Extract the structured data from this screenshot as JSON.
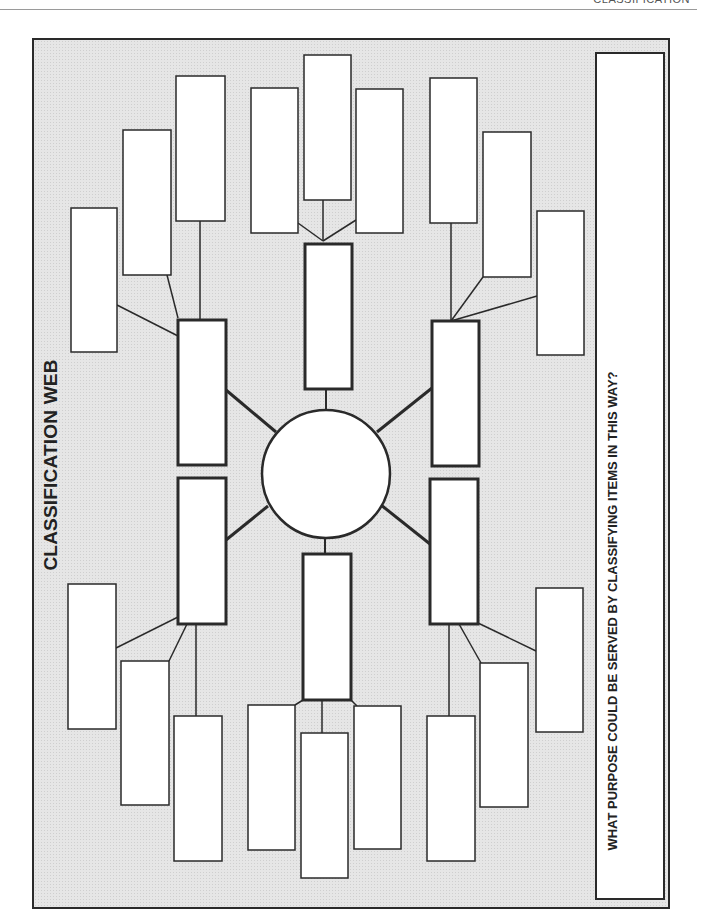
{
  "page": {
    "header_label": "CLASSIFICATION",
    "title": "CLASSIFICATION WEB",
    "purpose_question": "WHAT PURPOSE COULD BE SERVED BY CLASSIFYING ITEMS IN THIS WAY?",
    "colors": {
      "background_tint": "#e6e6e6",
      "stroke": "#2a2a2a",
      "box_fill": "#ffffff"
    }
  },
  "web": {
    "center_circle": {
      "cx": 326,
      "cy": 474,
      "r": 64,
      "label": ""
    },
    "category_boxes": [
      {
        "id": "upper-left",
        "x": 178,
        "y": 320,
        "w": 48,
        "h": 145,
        "label": ""
      },
      {
        "id": "lower-left",
        "x": 178,
        "y": 478,
        "w": 48,
        "h": 146,
        "label": ""
      },
      {
        "id": "top",
        "x": 305,
        "y": 244,
        "w": 47,
        "h": 145,
        "label": ""
      },
      {
        "id": "bottom",
        "x": 303,
        "y": 554,
        "w": 48,
        "h": 146,
        "label": ""
      },
      {
        "id": "upper-right",
        "x": 432,
        "y": 321,
        "w": 47,
        "h": 145,
        "label": ""
      },
      {
        "id": "lower-right",
        "x": 430,
        "y": 479,
        "w": 48,
        "h": 145,
        "label": ""
      }
    ],
    "item_boxes": [
      {
        "group": "upper-left",
        "x": 71,
        "y": 208,
        "w": 46,
        "h": 144,
        "label": ""
      },
      {
        "group": "upper-left",
        "x": 123,
        "y": 130,
        "w": 48,
        "h": 145,
        "label": ""
      },
      {
        "group": "upper-left",
        "x": 176,
        "y": 76,
        "w": 49,
        "h": 145,
        "label": ""
      },
      {
        "group": "top",
        "x": 251,
        "y": 88,
        "w": 47,
        "h": 145,
        "label": ""
      },
      {
        "group": "top",
        "x": 304,
        "y": 55,
        "w": 47,
        "h": 145,
        "label": ""
      },
      {
        "group": "top",
        "x": 356,
        "y": 89,
        "w": 47,
        "h": 144,
        "label": ""
      },
      {
        "group": "upper-right",
        "x": 430,
        "y": 78,
        "w": 47,
        "h": 145,
        "label": ""
      },
      {
        "group": "upper-right",
        "x": 483,
        "y": 132,
        "w": 48,
        "h": 145,
        "label": ""
      },
      {
        "group": "upper-right",
        "x": 537,
        "y": 211,
        "w": 47,
        "h": 144,
        "label": ""
      },
      {
        "group": "lower-left",
        "x": 68,
        "y": 584,
        "w": 48,
        "h": 145,
        "label": ""
      },
      {
        "group": "lower-left",
        "x": 121,
        "y": 661,
        "w": 48,
        "h": 144,
        "label": ""
      },
      {
        "group": "lower-left",
        "x": 174,
        "y": 716,
        "w": 48,
        "h": 145,
        "label": ""
      },
      {
        "group": "bottom",
        "x": 248,
        "y": 705,
        "w": 47,
        "h": 145,
        "label": ""
      },
      {
        "group": "bottom",
        "x": 301,
        "y": 733,
        "w": 47,
        "h": 145,
        "label": ""
      },
      {
        "group": "bottom",
        "x": 354,
        "y": 706,
        "w": 47,
        "h": 143,
        "label": ""
      },
      {
        "group": "lower-right",
        "x": 536,
        "y": 588,
        "w": 47,
        "h": 144,
        "label": ""
      },
      {
        "group": "lower-right",
        "x": 480,
        "y": 663,
        "w": 48,
        "h": 144,
        "label": ""
      },
      {
        "group": "lower-right",
        "x": 427,
        "y": 716,
        "w": 48,
        "h": 145,
        "label": ""
      }
    ],
    "purpose_answer": ""
  }
}
